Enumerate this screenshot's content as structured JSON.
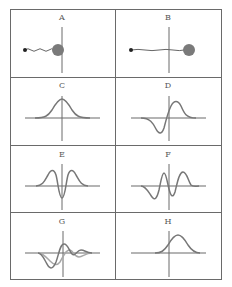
{
  "figure": {
    "layout": {
      "rows": 4,
      "cols": 2
    },
    "colors": {
      "border": "#6a6a6a",
      "axis": "#6a6a6a",
      "curve_dark": "#777777",
      "curve_light": "#a8a8a8",
      "particle_small": "#222222",
      "particle_large": "#7a7a7a"
    },
    "panels": [
      {
        "label": "A",
        "content": "small particle connected by wavy line to large particle at vertical axis"
      },
      {
        "label": "B",
        "content": "small particle connected by wavy line through vertical axis to large particle on right"
      },
      {
        "label": "C",
        "content": "symmetric Gaussian peak centered on vertical axis"
      },
      {
        "label": "D",
        "content": "antisymmetric wave: dip left of axis, peak right of axis"
      },
      {
        "label": "E",
        "content": "two peaks symmetric about axis with central dip"
      },
      {
        "label": "F",
        "content": "oscillating wave: dip, peak, dip, peak"
      },
      {
        "label": "G",
        "content": "two overlapping damped oscillations (dark and light)"
      },
      {
        "label": "H",
        "content": "Gaussian peak shifted right of vertical axis"
      }
    ]
  }
}
